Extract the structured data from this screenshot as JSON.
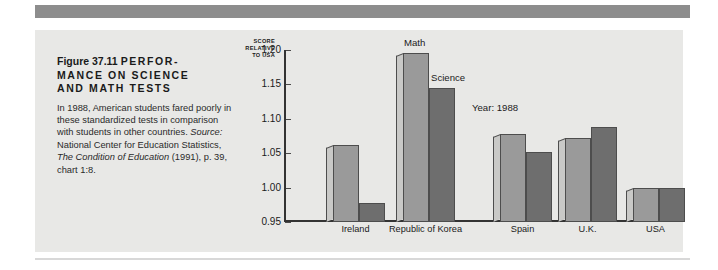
{
  "figure": {
    "label": "Figure 37.11",
    "headline": "PERFOR-MANCE ON SCIENCE AND MATH TESTS",
    "headline_line1": "PERFOR-",
    "headline_line2": "MANCE ON SCIENCE",
    "headline_line3": "AND MATH TESTS",
    "body_part1": "In 1988, American students fared poorly in these standardized tests in comparison with students in other countries. ",
    "body_source_label": "Source:",
    "body_part2": " National Center for Education Statistics, ",
    "body_source_italic": "The Condition of Education",
    "body_part3": " (1991), p. 39, chart 1:8."
  },
  "axis_title": {
    "line1": "SCORE",
    "line2": "RELATIVE",
    "line3": "TO USA"
  },
  "annotations": {
    "math_label": "Math",
    "science_label": "Science",
    "year_label": "Year: 1988"
  },
  "colors": {
    "page_background": "#ffffff",
    "panel_background": "#e8e8e6",
    "rule": "#8d8d8d",
    "math_bar": "#9a9a9a",
    "science_bar": "#6e6e6e",
    "bar_side_face": "#c9c9c7",
    "bar_outline": "#4d4d4d",
    "axis": "#333333",
    "text": "#1a1a1a"
  },
  "chart_data": {
    "type": "bar",
    "xlabel": "",
    "ylabel": "SCORE RELATIVE TO USA",
    "ylim": [
      0.95,
      1.2
    ],
    "yticks": [
      "0.95",
      "1.00",
      "1.05",
      "1.10",
      "1.15",
      "1.20"
    ],
    "ytick_values": [
      0.95,
      1.0,
      1.05,
      1.1,
      1.15,
      1.2
    ],
    "grid": false,
    "legend": "inline-annotation",
    "categories": [
      "Ireland",
      "Republic of Korea",
      "Spain",
      "U.K.",
      "USA"
    ],
    "series": [
      {
        "name": "Math",
        "values": [
          1.062,
          1.195,
          1.078,
          1.072,
          1.0
        ]
      },
      {
        "name": "Science",
        "values": [
          0.978,
          1.145,
          1.052,
          1.088,
          1.0
        ]
      }
    ],
    "annotations": [
      "Math",
      "Science",
      "Year: 1988"
    ]
  }
}
